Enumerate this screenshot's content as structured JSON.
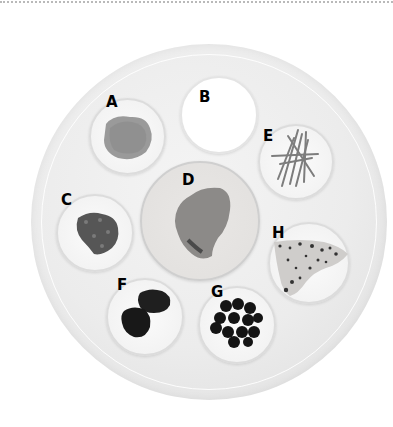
{
  "figure": {
    "samples": [
      {
        "id": "A",
        "label": "A",
        "appearance": "fine light-grey granular material"
      },
      {
        "id": "B",
        "label": "B",
        "appearance": "white/empty dish"
      },
      {
        "id": "C",
        "label": "C",
        "appearance": "dark crumbled flakes"
      },
      {
        "id": "D",
        "label": "D",
        "appearance": "large mid-grey lump on large plate"
      },
      {
        "id": "E",
        "label": "E",
        "appearance": "thin grey strands / sticks"
      },
      {
        "id": "F",
        "label": "F",
        "appearance": "dark lumpy pieces"
      },
      {
        "id": "G",
        "label": "G",
        "appearance": "cluster of dark round berries"
      },
      {
        "id": "H",
        "label": "H",
        "appearance": "pale speckled sheet with dark spots"
      }
    ]
  },
  "colors": {
    "background": "#ffffff",
    "tray": "#ececec",
    "dish": "#f5f5f5",
    "label": "#000000"
  }
}
